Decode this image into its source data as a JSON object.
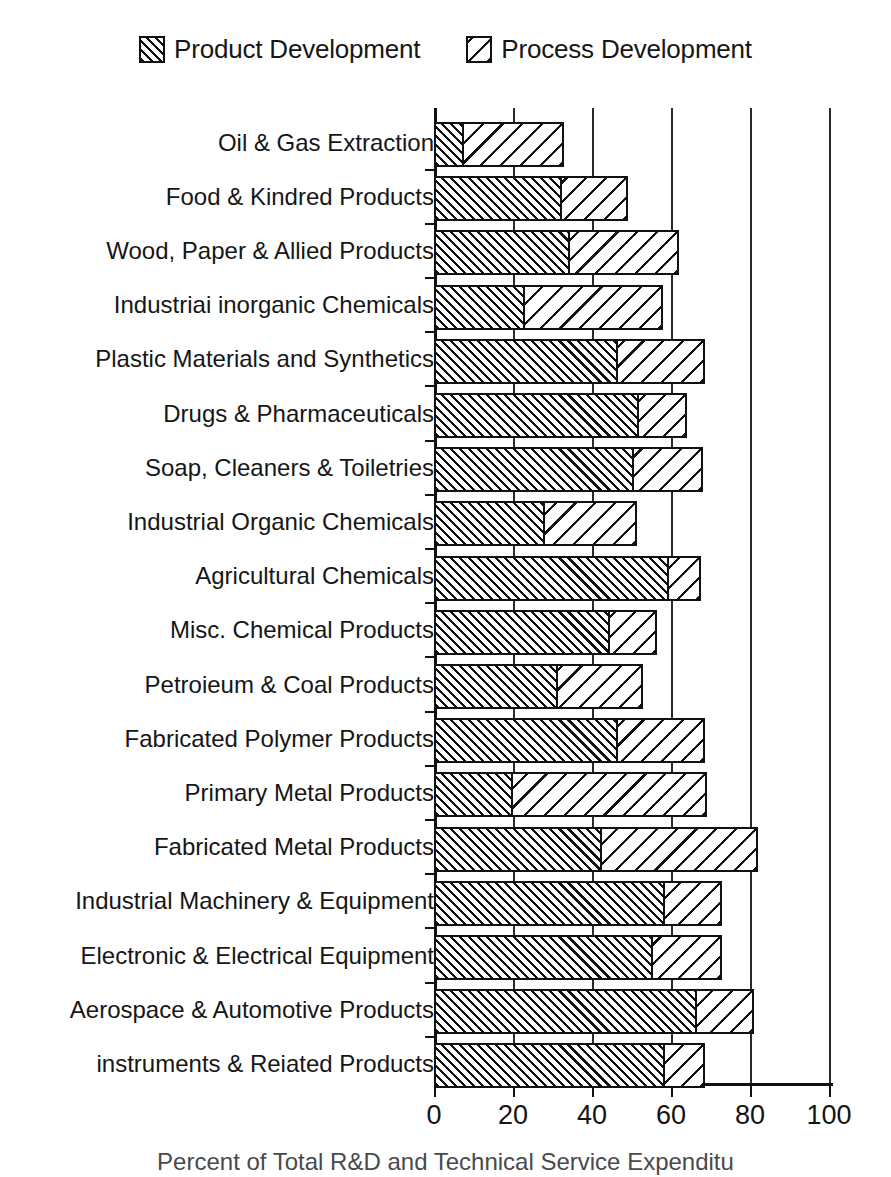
{
  "legend": {
    "entries": [
      {
        "label": "Product Development",
        "pattern": "dense-forward-hatch",
        "color": "#111111"
      },
      {
        "label": "Process Development",
        "pattern": "sparse-back-hatch",
        "color": "#111111"
      }
    ]
  },
  "caption": {
    "text": "Percent of Total R&D and Technical Service Expenditu"
  },
  "axis": {
    "x_ticks": [
      "0",
      "20",
      "40",
      "60",
      "80",
      "100"
    ],
    "x_tick_values": [
      0,
      20,
      40,
      60,
      80,
      100
    ],
    "x_min": 0,
    "x_max": 100
  },
  "chart_data": {
    "type": "bar",
    "orientation": "horizontal",
    "stacked": true,
    "title": "",
    "subtitle": "",
    "xlabel": "Percent of Total R&D and Technical Service Expenditu",
    "ylabel": "",
    "xlim": [
      0,
      100
    ],
    "xticks": [
      0,
      20,
      40,
      60,
      80,
      100
    ],
    "grid": "vertical",
    "legend_position": "top-center",
    "categories": [
      "Oil & Gas Extraction",
      "Food & Kindred Products",
      "Wood, Paper & Allied Products",
      "Industriai inorganic Chemicals",
      "Plastic Materials and Synthetics",
      "Drugs & Pharmaceuticals",
      "Soap, Cleaners & Toiletries",
      "Industrial Organic Chemicals",
      "Agricultural Chemicals",
      "Misc. Chemical Products",
      "Petroieum & Coal Products",
      "Fabricated Polymer Products",
      "Primary Metal Products",
      "Fabricated Metal Products",
      "Industrial Machinery & Equipment",
      "Electronic & Electrical Equipment",
      "Aerospace & Automotive Products",
      "instruments & Reiated Products"
    ],
    "series": [
      {
        "name": "Product Development",
        "values": [
          7,
          32,
          34,
          22.5,
          46,
          51.5,
          50,
          27.5,
          59,
          44,
          31,
          46,
          19.5,
          42,
          58,
          55,
          66,
          58
        ]
      },
      {
        "name": "Process Development",
        "values": [
          25,
          16,
          27,
          34.5,
          21.5,
          11.5,
          17,
          23,
          7.5,
          11.5,
          21,
          21.5,
          48.5,
          39,
          14,
          17,
          14,
          9.5
        ]
      }
    ],
    "totals": [
      32,
      48,
      61,
      57,
      67.5,
      63,
      67,
      50.5,
      66.5,
      55.5,
      52,
      67.5,
      68,
      81,
      72,
      72,
      80,
      67.5
    ]
  }
}
